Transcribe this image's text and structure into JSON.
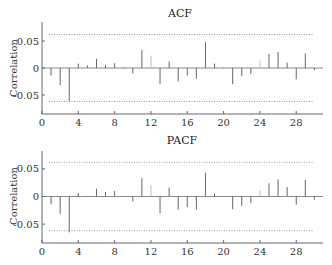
{
  "chart_data": [
    {
      "type": "bar",
      "title": "ACF",
      "xlabel": "",
      "ylabel": "Correlation",
      "xlim": [
        0,
        31
      ],
      "ylim": [
        -0.08,
        0.09
      ],
      "xticks": [
        0,
        4,
        8,
        12,
        16,
        20,
        24,
        28
      ],
      "yticks": [
        0.05,
        0,
        -0.05
      ],
      "ytick_labels": [
        "0.05",
        "0",
        "-0.05"
      ],
      "confidence_band": [
        -0.062,
        0.062
      ],
      "grid": false,
      "x": [
        1,
        2,
        3,
        4,
        5,
        6,
        7,
        8,
        9,
        10,
        11,
        12,
        13,
        14,
        15,
        16,
        17,
        18,
        19,
        20,
        21,
        22,
        23,
        24,
        25,
        26,
        27,
        28,
        29,
        30
      ],
      "values": [
        -0.014,
        -0.032,
        -0.061,
        0.008,
        0.005,
        0.017,
        0.006,
        0.009,
        0.001,
        -0.01,
        0.033,
        0.023,
        -0.03,
        0.012,
        -0.025,
        -0.014,
        -0.02,
        0.048,
        0.008,
        0.001,
        -0.03,
        -0.015,
        -0.011,
        0.014,
        0.026,
        0.03,
        0.01,
        -0.021,
        0.027,
        -0.004
      ]
    },
    {
      "type": "bar",
      "title": "PACF",
      "xlabel": "",
      "ylabel": "Correlation",
      "xlim": [
        0,
        31
      ],
      "ylim": [
        -0.08,
        0.09
      ],
      "xticks": [
        0,
        4,
        8,
        12,
        16,
        20,
        24,
        28
      ],
      "yticks": [
        0.05,
        0,
        -0.05
      ],
      "ytick_labels": [
        "0.05",
        "0",
        "-0.05"
      ],
      "confidence_band": [
        -0.062,
        0.062
      ],
      "grid": false,
      "x": [
        1,
        2,
        3,
        4,
        5,
        6,
        7,
        8,
        9,
        10,
        11,
        12,
        13,
        14,
        15,
        16,
        17,
        18,
        19,
        20,
        21,
        22,
        23,
        24,
        25,
        26,
        27,
        28,
        29,
        30
      ],
      "values": [
        -0.014,
        -0.032,
        -0.065,
        0.006,
        0.001,
        0.014,
        0.008,
        0.01,
        0.001,
        -0.009,
        0.033,
        0.021,
        -0.03,
        0.016,
        -0.024,
        -0.019,
        -0.024,
        0.043,
        0.005,
        0.001,
        -0.023,
        -0.017,
        -0.012,
        0.011,
        0.024,
        0.031,
        0.017,
        -0.015,
        0.03,
        -0.006
      ]
    }
  ],
  "panels": [
    {
      "title": "ACF",
      "ylabel": "Correlation",
      "layout": {
        "top": 22,
        "zero_y": 68,
        "axis_y": 114,
        "px_per_unit": 540
      }
    },
    {
      "title": "PACF",
      "ylabel": "Correlation",
      "layout": {
        "top": 151,
        "zero_y": 196.5,
        "axis_y": 243,
        "px_per_unit": 552
      }
    }
  ],
  "colors": {
    "bar": "#666666",
    "faint_bar": "#bbbbbb",
    "axis": "#666666",
    "confidence": "#999999"
  }
}
